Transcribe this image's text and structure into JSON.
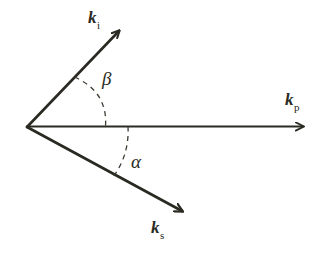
{
  "figure": {
    "background_color": "#ffffff",
    "stroke_color": "#2a2a22",
    "origin": {
      "x": 27,
      "y": 127
    }
  },
  "vectors": [
    {
      "id": "ki",
      "symbol": "k",
      "subscript": "i",
      "name": "incident-wave-vector",
      "tip": {
        "x": 126,
        "y": 25
      },
      "label_text": "k",
      "label_sub": "i"
    },
    {
      "id": "kp",
      "symbol": "k",
      "subscript": "p",
      "name": "pump-wave-vector",
      "tip": {
        "x": 312,
        "y": 126
      },
      "label_text": "k",
      "label_sub": "p"
    },
    {
      "id": "ks",
      "symbol": "k",
      "subscript": "s",
      "name": "scattered-wave-vector",
      "tip": {
        "x": 190,
        "y": 217
      },
      "label_text": "k",
      "label_sub": "s"
    }
  ],
  "angles": [
    {
      "id": "beta",
      "glyph": "β",
      "name": "angle-beta",
      "between": [
        "ki",
        "kp"
      ]
    },
    {
      "id": "alpha",
      "glyph": "α",
      "name": "angle-alpha",
      "between": [
        "kp",
        "ks"
      ]
    }
  ],
  "colors": {
    "stroke": "#2a2a22",
    "background": "#ffffff",
    "dashed": "#3a3a30"
  }
}
